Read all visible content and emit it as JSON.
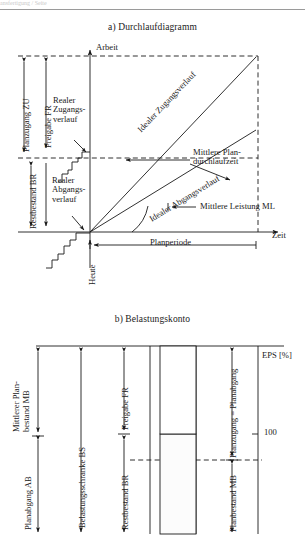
{
  "page": {
    "cut_off_header": "ansfertigung / Seite",
    "figure_a_caption": "a) Durchlaufdiagramm",
    "figure_b_caption": "b) Belastungskonto"
  },
  "diagram_a": {
    "name": "Durchlaufdiagramm",
    "axis_y_label": "Arbeit",
    "axis_x_label": "Zeit",
    "today_label": "Heute",
    "dimensions": [
      {
        "id": "planzugang",
        "label": "Planzugang ZU"
      },
      {
        "id": "freigabe",
        "label": "Freigabe FR"
      },
      {
        "id": "restbestand",
        "label": "Restbestand BR"
      },
      {
        "id": "planperiode",
        "label": "Planperiode"
      }
    ],
    "curve_labels": [
      {
        "id": "realer-zugangsverlauf",
        "line1": "Realer",
        "line2": "Zugangs-",
        "line3": "verlauf"
      },
      {
        "id": "realer-abgangsverlauf",
        "line1": "Realer",
        "line2": "Abgangs-",
        "line3": "verlauf"
      },
      {
        "id": "idealer-zugangsverlauf",
        "label": "Idealer Zugangsverlauf"
      },
      {
        "id": "idealer-abgangsverlauf",
        "label": "Idealer Abgangsverlauf"
      }
    ],
    "annotations": [
      {
        "id": "mittlere-plan-durchlaufzeit",
        "line1": "Mittlere Plan-",
        "line2": "durchlaufzeit"
      },
      {
        "id": "mittlere-leistung",
        "label": "Mittlere Leistung ML"
      }
    ]
  },
  "diagram_b": {
    "name": "Belastungskonto",
    "axis_label": "EPS [%]",
    "tick_value": "100",
    "dimensions": [
      {
        "id": "mittlerer-planbestand",
        "line1": "Mittlerer Plan-",
        "line2": "bestand MB"
      },
      {
        "id": "planabgang",
        "label": "Planabgang AB"
      },
      {
        "id": "belastungsschranke",
        "label": "Belastungsschranke BS"
      },
      {
        "id": "freigabe",
        "label": "Freigabe FR"
      },
      {
        "id": "restbestand",
        "label": "Restbestand BR"
      },
      {
        "id": "planzugang-planabgang",
        "label": "Planzugang = Planabgang"
      },
      {
        "id": "planbestand",
        "label": "Planbestand MB"
      }
    ]
  },
  "colors": {
    "ink": "#1a1a1a",
    "rule": "#9a9a9a",
    "box_fill": "#fbfbfb",
    "ghost": "#c9c9c9"
  }
}
